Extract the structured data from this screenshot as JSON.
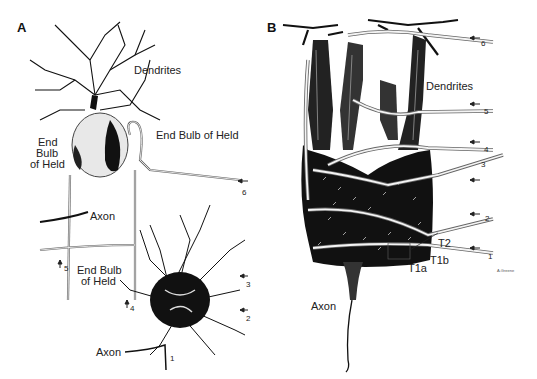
{
  "figure": {
    "panels": [
      {
        "id": "A",
        "letter": "A",
        "labels": {
          "dendrites": "Dendrites",
          "end_bulb_right": "End Bulb of Held",
          "end_bulb_left_1": "End",
          "end_bulb_left_2": "Bulb",
          "end_bulb_left_3": "of Held",
          "axon_upper": "Axon",
          "end_bulb_lower_1": "End Bulb",
          "end_bulb_lower_2": "of Held",
          "axon_lower": "Axon"
        },
        "input_numbers": [
          "1",
          "2",
          "3",
          "4",
          "5",
          "6"
        ]
      },
      {
        "id": "B",
        "letter": "B",
        "labels": {
          "dendrites": "Dendrites",
          "axon": "Axon",
          "t2": "T2",
          "t1b": "T1b",
          "t1a": "T1a",
          "signature": "A.Greene"
        },
        "input_numbers": [
          "1",
          "2",
          "3",
          "4",
          "5",
          "6"
        ]
      }
    ]
  }
}
